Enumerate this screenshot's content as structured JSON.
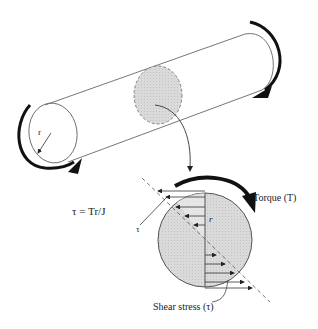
{
  "diagram": {
    "labels": {
      "radius_cylinder": "r",
      "formula": "τ = Tr/J",
      "tau": "τ",
      "radius_section": "r",
      "torque": "Torque (T)",
      "shear_stress": "Shear stress (τ)"
    },
    "colors": {
      "line": "#555555",
      "arrow": "#111111",
      "shade": "#d4d4d4"
    }
  }
}
